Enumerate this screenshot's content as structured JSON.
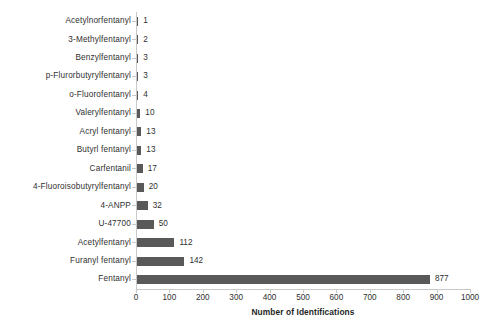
{
  "chart_data": {
    "type": "bar",
    "orientation": "horizontal",
    "title": "",
    "subtitle": "",
    "xlabel": "Number of Identifications",
    "ylabel": "",
    "xlim": [
      0,
      1000
    ],
    "xticks": [
      0,
      100,
      200,
      300,
      400,
      500,
      600,
      700,
      800,
      900,
      1000
    ],
    "xtick_labels": [
      "0",
      "100",
      "200",
      "300",
      "400",
      "500",
      "600",
      "700",
      "800",
      "900",
      "1000"
    ],
    "grid": false,
    "legend": false,
    "legend_position": "none",
    "bar_color": "#595959",
    "axis_color": "#c9c9c9",
    "data_labels": true,
    "categories": [
      "Acetylnorfentanyl",
      "3-Methylfentanyl",
      "Benzylfentanyl",
      "p-Flurorbutyrylfentanyl",
      "o-Fluorofentanyl",
      "Valerylfentanyl",
      "Acryl fentanyl",
      "Butyrl fentanyl",
      "Carfentanil",
      "4-Fluoroisobutyrylfentanyl",
      "4-ANPP",
      "U-47700",
      "Acetylfentanyl",
      "Furanyl fentanyl",
      "Fentanyl"
    ],
    "values": [
      1,
      2,
      3,
      3,
      4,
      10,
      13,
      13,
      17,
      20,
      32,
      50,
      112,
      142,
      877
    ],
    "value_labels": [
      "1",
      "2",
      "3",
      "3",
      "4",
      "10",
      "13",
      "13",
      "17",
      "20",
      "32",
      "50",
      "112",
      "142",
      "877"
    ]
  }
}
